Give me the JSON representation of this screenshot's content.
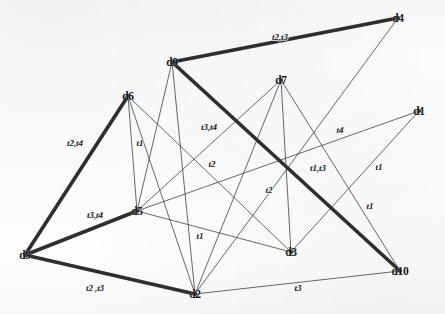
{
  "figure": {
    "kind": "undirected-labeled-graph",
    "background_color": "#fdfdfd",
    "edge_color_thick": "#232427",
    "edge_color_thin": "#3a3b3f",
    "label_color": "#15161a"
  },
  "nodes": [
    {
      "id": "d4",
      "label": "d4",
      "x": 398,
      "y": 18
    },
    {
      "id": "d9",
      "label": "d9",
      "x": 172,
      "y": 62
    },
    {
      "id": "d7",
      "label": "d7",
      "x": 281,
      "y": 80
    },
    {
      "id": "d6",
      "label": "d6",
      "x": 128,
      "y": 96
    },
    {
      "id": "d1",
      "label": "d1",
      "x": 419,
      "y": 111
    },
    {
      "id": "d5",
      "label": "d5",
      "x": 137,
      "y": 211
    },
    {
      "id": "d3",
      "label": "d3",
      "x": 291,
      "y": 252
    },
    {
      "id": "d0",
      "label": "d9",
      "x": 25,
      "y": 255
    },
    {
      "id": "d2",
      "label": "d2",
      "x": 195,
      "y": 294
    },
    {
      "id": "d10",
      "label": "d10",
      "x": 400,
      "y": 271
    }
  ],
  "edges": [
    {
      "id": "e1",
      "from": "d9",
      "to": "d4",
      "weight": "thick",
      "label": "t2,t3",
      "label_x": 280,
      "label_y": 37
    },
    {
      "id": "e2",
      "from": "d0",
      "to": "d6",
      "weight": "thick",
      "label": "t2,t4",
      "label_x": 75,
      "label_y": 143
    },
    {
      "id": "e3",
      "from": "d0",
      "to": "d5",
      "weight": "thick",
      "label": "t3,t4",
      "label_x": 95,
      "label_y": 215
    },
    {
      "id": "e4",
      "from": "d0",
      "to": "d2",
      "weight": "thick",
      "label": "t2 ,t3",
      "label_x": 95,
      "label_y": 288
    },
    {
      "id": "e5",
      "from": "d9",
      "to": "d10",
      "weight": "thick",
      "label": "t1,t3",
      "label_x": 318,
      "label_y": 168
    },
    {
      "id": "e6",
      "from": "d6",
      "to": "d5",
      "weight": "thin",
      "label": "t1",
      "label_x": 140,
      "label_y": 143
    },
    {
      "id": "e7",
      "from": "d7",
      "to": "d2",
      "weight": "thin",
      "label": "t2",
      "label_x": 269,
      "label_y": 190
    },
    {
      "id": "e8",
      "from": "d6",
      "to": "d3",
      "weight": "thin",
      "label": "t2",
      "label_x": 212,
      "label_y": 164
    },
    {
      "id": "e9",
      "from": "d5",
      "to": "d7",
      "weight": "thin",
      "label": "t3,t4",
      "label_x": 209,
      "label_y": 127
    },
    {
      "id": "e10",
      "from": "d5",
      "to": "d1",
      "weight": "thin",
      "label": "t4",
      "label_x": 340,
      "label_y": 130
    },
    {
      "id": "e11",
      "from": "d3",
      "to": "d1",
      "weight": "thin",
      "label": "t1",
      "label_x": 379,
      "label_y": 167
    },
    {
      "id": "e12",
      "from": "d7",
      "to": "d10",
      "weight": "thin",
      "label": "t1",
      "label_x": 370,
      "label_y": 206
    },
    {
      "id": "e13",
      "from": "d5",
      "to": "d3",
      "weight": "thin",
      "label": "t1",
      "label_x": 200,
      "label_y": 236
    },
    {
      "id": "e14",
      "from": "d2",
      "to": "d10",
      "weight": "thin",
      "label": "t3",
      "label_x": 298,
      "label_y": 288
    },
    {
      "id": "e15",
      "from": "d9",
      "to": "d2",
      "weight": "thin",
      "label": "",
      "label_x": 0,
      "label_y": 0
    },
    {
      "id": "e16",
      "from": "d9",
      "to": "d5",
      "weight": "thin",
      "label": "",
      "label_x": 0,
      "label_y": 0
    },
    {
      "id": "e17",
      "from": "d6",
      "to": "d2",
      "weight": "thin",
      "label": "",
      "label_x": 0,
      "label_y": 0
    },
    {
      "id": "e18",
      "from": "d4",
      "to": "d2",
      "weight": "thin",
      "label": "",
      "label_x": 0,
      "label_y": 0
    },
    {
      "id": "e19",
      "from": "d7",
      "to": "d3",
      "weight": "thin",
      "label": "",
      "label_x": 0,
      "label_y": 0
    }
  ],
  "edge_label_legend": [
    "t1",
    "t2",
    "t3",
    "t4"
  ]
}
